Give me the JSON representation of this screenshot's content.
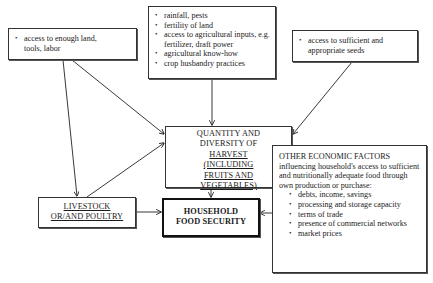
{
  "diagram": {
    "boxes": {
      "resources": {
        "items": [
          "access to enough land, tools, labor"
        ]
      },
      "production_conditions": {
        "items": [
          "rainfall, pests",
          "fertility of land",
          "access to agricultural inputs, e.g. fertilizer, draft power",
          "agricultural know-how",
          "crop husbandry practices"
        ]
      },
      "seeds": {
        "items": [
          "access to sufficient and appropriate seeds"
        ]
      },
      "harvest": {
        "line1": "QUANTITY AND",
        "line2": "DIVERSITY OF",
        "line3": "HARVEST",
        "line4": "(INCLUDING",
        "line5": "FRUITS AND",
        "line6": "VEGETABLES)"
      },
      "livestock": {
        "line1": "LIVESTOCK",
        "line2": "OR/AND POULTRY"
      },
      "food_security": {
        "line1": "HOUSEHOLD",
        "line2": "FOOD SECURITY"
      },
      "economic_factors": {
        "title": "OTHER ECONOMIC FACTORS",
        "description": "influencing household's access to sufficient and nutritionally adequate food through own production or purchase:",
        "items": [
          "debts, income, savings",
          "processing and storage capacity",
          "terms of trade",
          "presence of commercial networks",
          "market prices"
        ]
      }
    },
    "edges": [
      {
        "from": "resources",
        "to": "harvest"
      },
      {
        "from": "resources",
        "to": "livestock"
      },
      {
        "from": "production_conditions",
        "to": "harvest"
      },
      {
        "from": "seeds",
        "to": "harvest"
      },
      {
        "from": "livestock",
        "to": "harvest"
      },
      {
        "from": "harvest",
        "to": "food_security"
      },
      {
        "from": "livestock",
        "to": "food_security"
      },
      {
        "from": "economic_factors",
        "to": "food_security"
      }
    ]
  }
}
